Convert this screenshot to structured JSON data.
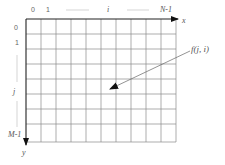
{
  "diagram": {
    "grid": {
      "columns": 10,
      "rows": 8
    },
    "x_axis": {
      "label": "x",
      "ticks": [
        "0",
        "1",
        "i",
        "N-1"
      ]
    },
    "y_axis": {
      "label": "y",
      "ticks": [
        "0",
        "1",
        "j",
        "M-1"
      ]
    },
    "annotation": {
      "label": "f(j, i)",
      "points_to": "pixel"
    },
    "colors": {
      "grid": "#777777",
      "axis": "#222222",
      "text": "#555555"
    }
  }
}
